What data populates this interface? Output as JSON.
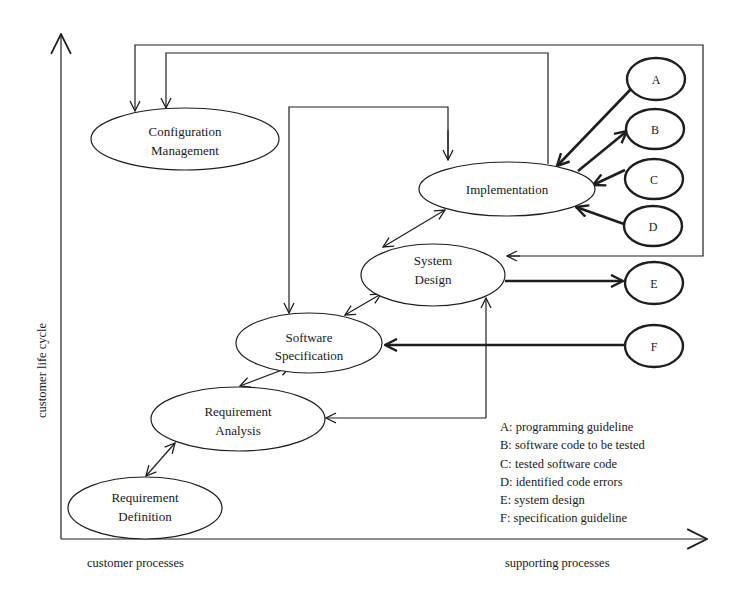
{
  "axes": {
    "y_label": "customer life cycle",
    "x_left_label": "customer processes",
    "x_right_label": "supporting processes"
  },
  "nodes": {
    "configuration_management": {
      "line1": "Configuration",
      "line2": "Management"
    },
    "implementation": {
      "line1": "Implementation"
    },
    "system_design": {
      "line1": "System",
      "line2": "Design"
    },
    "software_specification": {
      "line1": "Software",
      "line2": "Specification"
    },
    "requirement_analysis": {
      "line1": "Requirement",
      "line2": "Analysis"
    },
    "requirement_definition": {
      "line1": "Requirement",
      "line2": "Definition"
    }
  },
  "artifacts": {
    "A": "A",
    "B": "B",
    "C": "C",
    "D": "D",
    "E": "E",
    "F": "F"
  },
  "legend": [
    {
      "key": "A",
      "text": "A: programming guideline"
    },
    {
      "key": "B",
      "text": "B: software code to be tested"
    },
    {
      "key": "C",
      "text": "C: tested software code"
    },
    {
      "key": "D",
      "text": "D: identified code errors"
    },
    {
      "key": "E",
      "text": "E: system design"
    },
    {
      "key": "F",
      "text": "F: specification guideline"
    }
  ]
}
